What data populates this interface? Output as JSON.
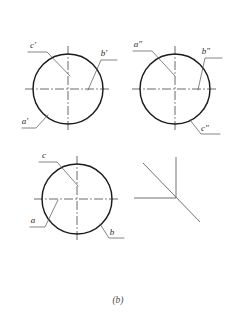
{
  "figure": {
    "caption": "(b)",
    "stroke_colors": {
      "circle": "#1c1c1c",
      "center_line": "#3a3a3a",
      "leader_line": "#555555",
      "axis_line": "#6a6a6a",
      "label_text": "#2a2a2a",
      "caption_text": "#4a4a4a",
      "background": "#ffffff"
    }
  },
  "views": [
    {
      "id": "front-view",
      "name": "front-view",
      "center": {
        "x": 68,
        "y": 89
      },
      "radius": 35,
      "labels": [
        {
          "id": "c-prime",
          "text": "c'",
          "x": 33,
          "y": 48
        },
        {
          "id": "b-prime",
          "text": "b'",
          "x": 104,
          "y": 56
        },
        {
          "id": "a-prime",
          "text": "a'",
          "x": 25,
          "y": 124
        }
      ]
    },
    {
      "id": "side-view",
      "name": "side-view",
      "center": {
        "x": 175,
        "y": 89
      },
      "radius": 35,
      "labels": [
        {
          "id": "a-double-prime",
          "text": "a\"",
          "x": 138,
          "y": 47
        },
        {
          "id": "b-double-prime",
          "text": "b\"",
          "x": 206,
          "y": 54
        },
        {
          "id": "c-double-prime",
          "text": "c\"",
          "x": 205,
          "y": 131
        }
      ]
    },
    {
      "id": "top-view",
      "name": "top-view",
      "center": {
        "x": 77,
        "y": 199
      },
      "radius": 35,
      "labels": [
        {
          "id": "c-point",
          "text": "c",
          "x": 44,
          "y": 158
        },
        {
          "id": "a-point",
          "text": "a",
          "x": 33,
          "y": 223
        },
        {
          "id": "b-point",
          "text": "b",
          "x": 112,
          "y": 235
        }
      ]
    }
  ],
  "axis_triad": {
    "id": "axis-triad",
    "origin": {
      "x": 176,
      "y": 198
    },
    "axes": [
      {
        "id": "axis-vertical",
        "direction": "up",
        "end": {
          "x": 176,
          "y": 157
        }
      },
      {
        "id": "axis-horizontal",
        "direction": "left",
        "end": {
          "x": 134,
          "y": 198
        }
      },
      {
        "id": "axis-diagonal",
        "direction": "down-right",
        "start": {
          "x": 143,
          "y": 163
        },
        "end": {
          "x": 200,
          "y": 222
        }
      }
    ]
  }
}
